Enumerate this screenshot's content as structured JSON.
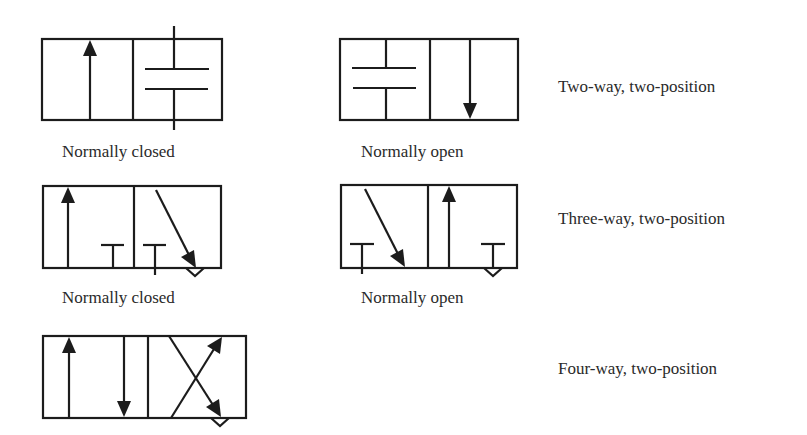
{
  "diagram": {
    "rows": [
      {
        "type_label": "Two-way, two-position",
        "symbols": [
          {
            "caption": "Normally closed"
          },
          {
            "caption": "Normally open"
          }
        ]
      },
      {
        "type_label": "Three-way, two-position",
        "symbols": [
          {
            "caption": "Normally closed"
          },
          {
            "caption": "Normally open"
          }
        ]
      },
      {
        "type_label": "Four-way, two-position",
        "symbols": [
          {
            "caption": ""
          }
        ]
      }
    ],
    "colors": {
      "line": "#1c1c1c",
      "text": "#2a2a2a",
      "background": "#ffffff"
    }
  }
}
